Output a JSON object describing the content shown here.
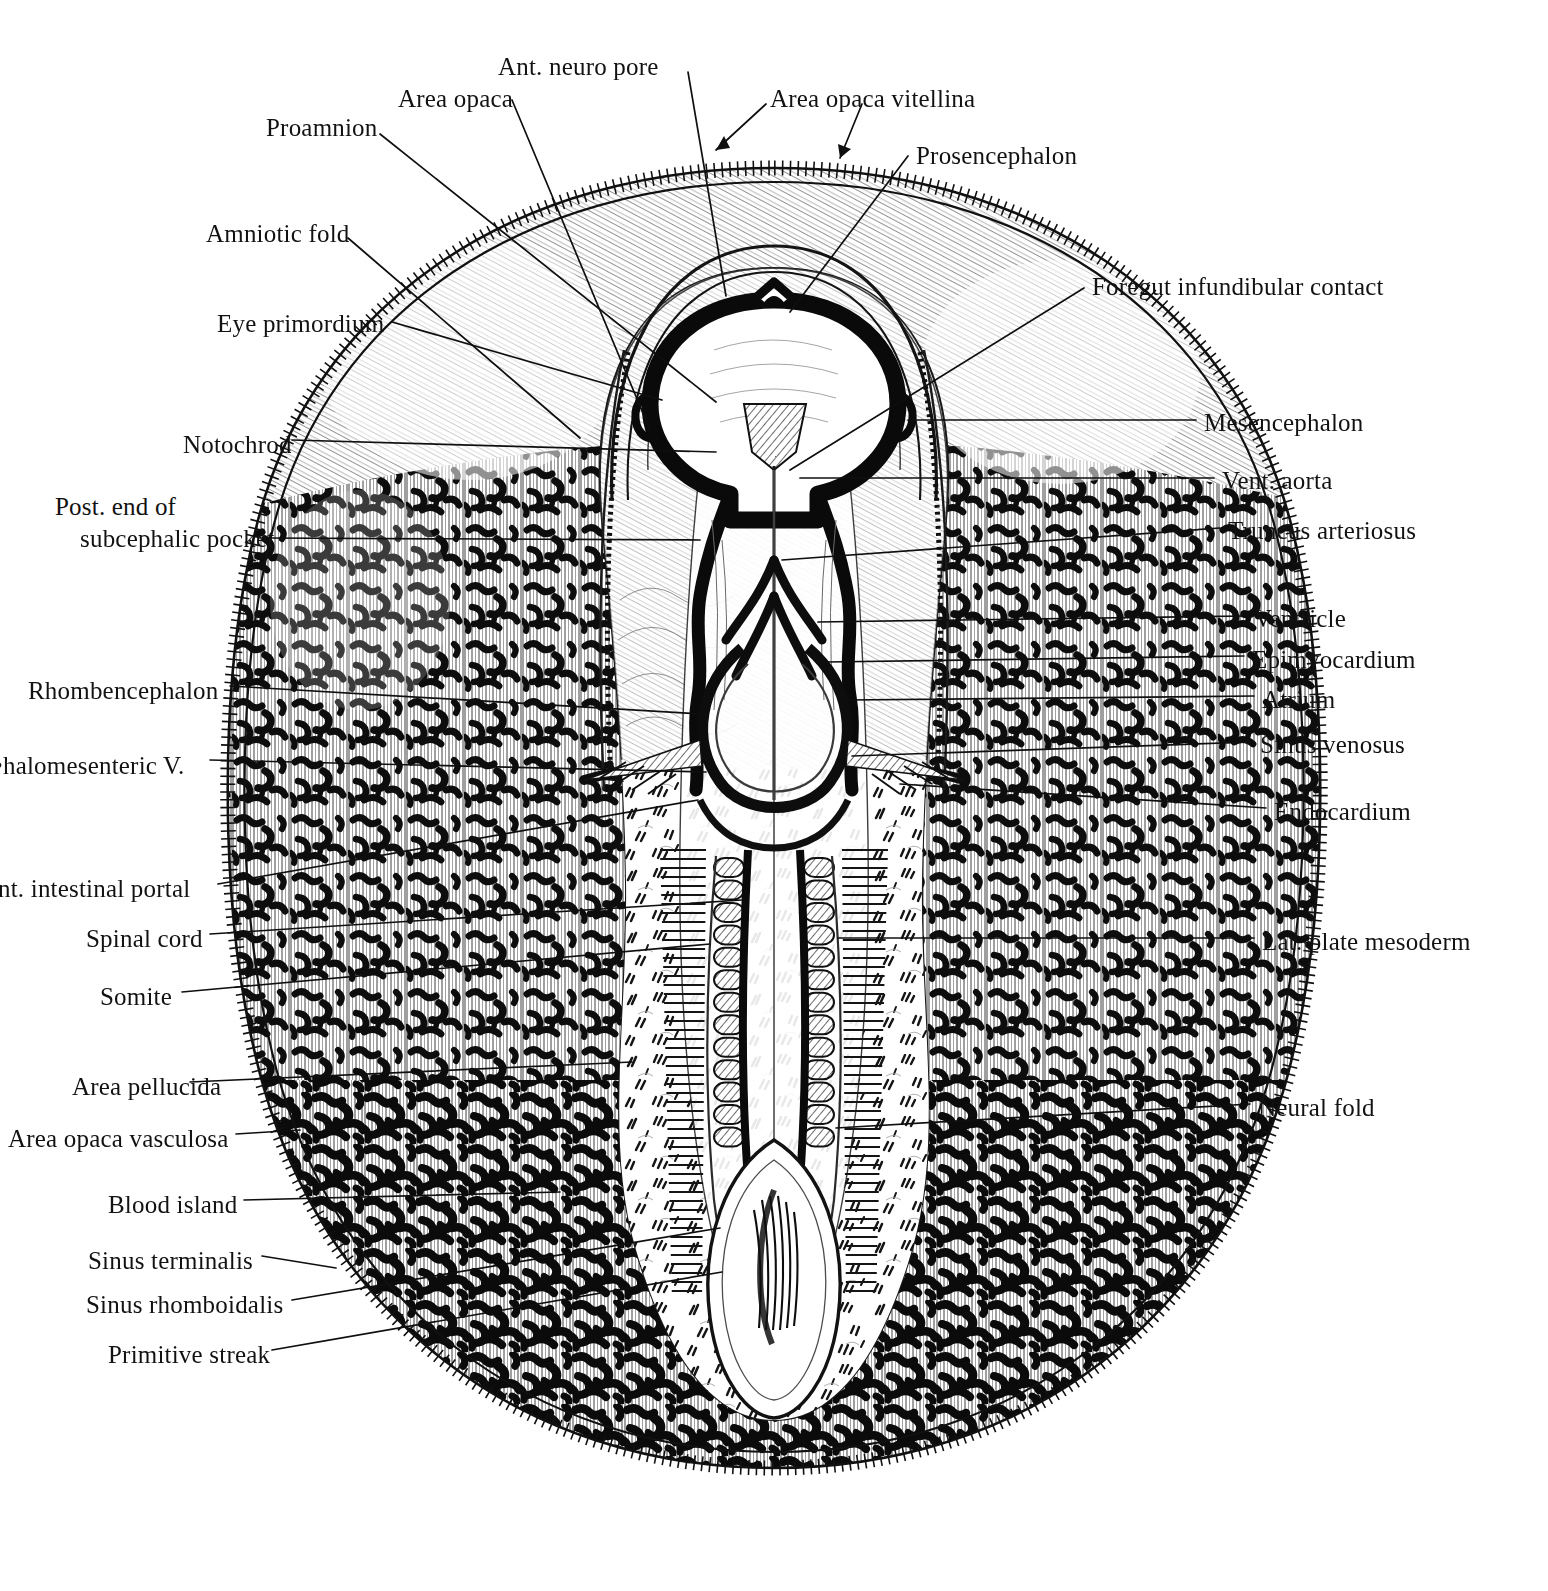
{
  "figure": {
    "style": "pen-and-ink line drawing, black on white",
    "background_color": "#ffffff",
    "ink_color": "#111111"
  },
  "labels_top": [
    {
      "id": "ant-neuro-pore",
      "text": "Ant. neuro pore",
      "x": 498,
      "y": 52,
      "align": "left"
    },
    {
      "id": "area-opaca",
      "text": "Area opaca",
      "x": 398,
      "y": 84,
      "align": "left"
    },
    {
      "id": "area-opaca-vitellina",
      "text": "Area opaca vitellina",
      "x": 770,
      "y": 84,
      "align": "left"
    },
    {
      "id": "proamnion",
      "text": "Proamnion",
      "x": 266,
      "y": 113,
      "align": "left"
    },
    {
      "id": "prosencephalon",
      "text": "Prosencephalon",
      "x": 916,
      "y": 141,
      "align": "left"
    },
    {
      "id": "amniotic-fold",
      "text": "Amniotic fold",
      "x": 206,
      "y": 219,
      "align": "left"
    },
    {
      "id": "foregut-infundibular",
      "text": "Foregut infundibular contact",
      "x": 1092,
      "y": 272,
      "align": "left"
    },
    {
      "id": "eye-primordium",
      "text": "Eye primordium",
      "x": 217,
      "y": 309,
      "align": "left"
    }
  ],
  "labels_left": [
    {
      "id": "notochord",
      "text": "Notochrod",
      "x": 183,
      "y": 430,
      "align": "left"
    },
    {
      "id": "post-end-line1",
      "text": "Post. end of",
      "x": 55,
      "y": 492,
      "align": "left"
    },
    {
      "id": "post-end-line2",
      "text": "subcephalic pocket",
      "x": 80,
      "y": 524,
      "align": "left"
    },
    {
      "id": "rhombencephalon",
      "text": "Rhombencephalon",
      "x": 28,
      "y": 676,
      "align": "left"
    },
    {
      "id": "omphalomesenteric-v",
      "text": "•halomesenteric V.",
      "x": -6,
      "y": 751,
      "align": "left"
    },
    {
      "id": "ant-intestinal-portal",
      "text": "nt. intestinal portal",
      "x": -2,
      "y": 874,
      "align": "left"
    },
    {
      "id": "spinal-cord",
      "text": "Spinal cord",
      "x": 86,
      "y": 924,
      "align": "left"
    },
    {
      "id": "somite",
      "text": "Somite",
      "x": 100,
      "y": 982,
      "align": "left"
    },
    {
      "id": "area-pellucida",
      "text": "Area pellucida",
      "x": 72,
      "y": 1072,
      "align": "left"
    },
    {
      "id": "area-opaca-vasculosa",
      "text": "Area opaca vasculosa",
      "x": 8,
      "y": 1124,
      "align": "left"
    },
    {
      "id": "blood-island",
      "text": "Blood island",
      "x": 108,
      "y": 1190,
      "align": "left"
    },
    {
      "id": "sinus-terminalis",
      "text": "Sinus terminalis",
      "x": 88,
      "y": 1246,
      "align": "left"
    },
    {
      "id": "sinus-rhomboidalis",
      "text": "Sinus rhomboidalis",
      "x": 86,
      "y": 1290,
      "align": "left"
    },
    {
      "id": "primitive-streak",
      "text": "Primitive streak",
      "x": 108,
      "y": 1340,
      "align": "left"
    }
  ],
  "labels_right": [
    {
      "id": "mesencephalon",
      "text": "Mesencephalon",
      "x": 1204,
      "y": 408,
      "align": "left"
    },
    {
      "id": "vent-aorta",
      "text": "Vent. aorta",
      "x": 1222,
      "y": 466,
      "align": "left"
    },
    {
      "id": "truncus-arteriosus",
      "text": "Truncus arteriosus",
      "x": 1228,
      "y": 516,
      "align": "left"
    },
    {
      "id": "ventricle",
      "text": "Ventricle",
      "x": 1254,
      "y": 604,
      "align": "left"
    },
    {
      "id": "epimyocardium",
      "text": "Epimyocardium",
      "x": 1252,
      "y": 645,
      "align": "left"
    },
    {
      "id": "atrium",
      "text": "Atrium",
      "x": 1262,
      "y": 685,
      "align": "left"
    },
    {
      "id": "sinus-venosus",
      "text": "Sinus venosus",
      "x": 1260,
      "y": 730,
      "align": "left"
    },
    {
      "id": "endocardium",
      "text": "Endocardium",
      "x": 1274,
      "y": 797,
      "align": "left"
    },
    {
      "id": "lat-plate-mesoderm",
      "text": "Lat. plate mesoderm",
      "x": 1262,
      "y": 927,
      "align": "left"
    },
    {
      "id": "neural-fold",
      "text": "Neural fold",
      "x": 1258,
      "y": 1093,
      "align": "left"
    }
  ],
  "anatomy_structures": [
    "Blastoderm outer margin (area opaca vitellina)",
    "Sinus terminalis ladder rim",
    "Area opaca vasculosa with blood islands",
    "Area pellucida (pear-shaped clear field)",
    "Proamnion",
    "Amniotic fold over head",
    "Prosencephalon",
    "Mesencephalon",
    "Rhombencephalon",
    "Optic vesicle / eye primordium",
    "Anterior neuropore",
    "Notochord",
    "Neural tube / spinal cord",
    "Neural folds",
    "Somites",
    "Lateral plate mesoderm",
    "Heart tube: truncus arteriosus, ventricle, atrium, sinus venosus",
    "Ventral aorta",
    "Omphalomesenteric veins",
    "Anterior intestinal portal",
    "Sinus rhomboidalis",
    "Primitive streak"
  ]
}
